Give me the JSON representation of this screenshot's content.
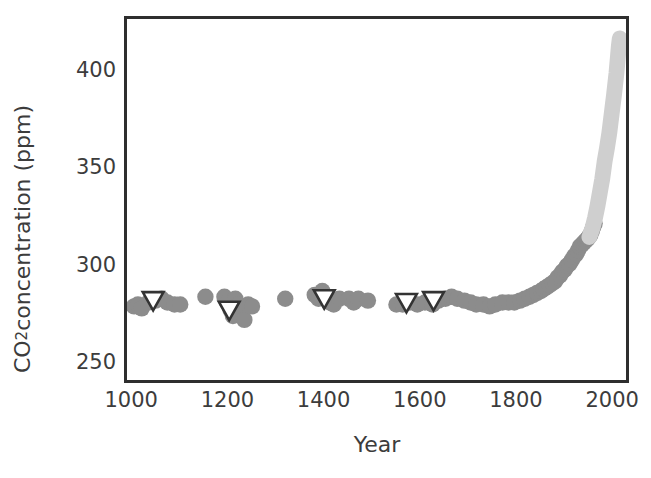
{
  "chart_data": {
    "type": "scatter",
    "title": "",
    "xlabel": "Year",
    "ylabel": "CO2 concentration (ppm)",
    "ylabel_prefix": "CO",
    "ylabel_sub": "2",
    "ylabel_suffix": " concentration (ppm)",
    "xlim": [
      985,
      2035
    ],
    "ylim": [
      240,
      428
    ],
    "xticks": [
      1000,
      1200,
      1400,
      1600,
      1800,
      2000
    ],
    "xtick_labels": [
      "1000",
      "1200",
      "1400",
      "1600",
      "1800",
      "2000"
    ],
    "yticks": [
      250,
      300,
      350,
      400
    ],
    "ytick_labels": [
      "250",
      "300",
      "350",
      "400"
    ],
    "grid": false,
    "legend": "none",
    "colors": {
      "ice_core_circle": "#8c8c8c",
      "modern_record": "#cfcfcf",
      "triangle_edge": "#333333",
      "triangle_fill": "#ffffff",
      "axis": "#2e2e2e",
      "text": "#3c3c3c"
    },
    "series": [
      {
        "name": "Ice core CO2 (circles)",
        "marker": "circle",
        "color": "#8c8c8c",
        "points": [
          [
            1000,
            279
          ],
          [
            1008,
            280
          ],
          [
            1016,
            278
          ],
          [
            1030,
            281
          ],
          [
            1045,
            282
          ],
          [
            1058,
            283
          ],
          [
            1070,
            281
          ],
          [
            1085,
            280
          ],
          [
            1097,
            280
          ],
          [
            1150,
            284
          ],
          [
            1190,
            284
          ],
          [
            1196,
            281
          ],
          [
            1203,
            277
          ],
          [
            1208,
            274
          ],
          [
            1213,
            283
          ],
          [
            1219,
            280
          ],
          [
            1224,
            276
          ],
          [
            1232,
            272
          ],
          [
            1240,
            280
          ],
          [
            1248,
            279
          ],
          [
            1318,
            283
          ],
          [
            1380,
            285
          ],
          [
            1388,
            283
          ],
          [
            1396,
            287
          ],
          [
            1404,
            284
          ],
          [
            1412,
            281
          ],
          [
            1420,
            280
          ],
          [
            1432,
            283
          ],
          [
            1452,
            283
          ],
          [
            1462,
            281
          ],
          [
            1472,
            283
          ],
          [
            1492,
            282
          ],
          [
            1552,
            280
          ],
          [
            1565,
            280
          ],
          [
            1580,
            281
          ],
          [
            1596,
            280
          ],
          [
            1612,
            281
          ],
          [
            1628,
            280
          ],
          [
            1640,
            282
          ],
          [
            1655,
            283
          ],
          [
            1668,
            284
          ],
          [
            1680,
            283
          ],
          [
            1695,
            282
          ],
          [
            1708,
            281
          ],
          [
            1720,
            280
          ],
          [
            1735,
            280
          ],
          [
            1748,
            279
          ],
          [
            1760,
            280
          ],
          [
            1775,
            281
          ],
          [
            1788,
            281
          ],
          [
            1800,
            281
          ],
          [
            1812,
            282
          ],
          [
            1822,
            283
          ],
          [
            1832,
            284
          ],
          [
            1840,
            285
          ],
          [
            1848,
            286
          ],
          [
            1856,
            287
          ],
          [
            1862,
            288
          ],
          [
            1868,
            289
          ],
          [
            1874,
            290
          ],
          [
            1880,
            291
          ],
          [
            1886,
            292
          ],
          [
            1891,
            294
          ],
          [
            1896,
            295
          ],
          [
            1901,
            297
          ],
          [
            1906,
            298
          ],
          [
            1911,
            300
          ],
          [
            1916,
            301
          ],
          [
            1921,
            303
          ],
          [
            1926,
            305
          ],
          [
            1930,
            306
          ],
          [
            1934,
            308
          ],
          [
            1938,
            310
          ],
          [
            1942,
            311
          ],
          [
            1946,
            312
          ],
          [
            1950,
            313
          ],
          [
            1954,
            314
          ],
          [
            1957,
            315
          ],
          [
            1960,
            316
          ],
          [
            1963,
            318
          ],
          [
            1966,
            320
          ],
          [
            1969,
            322
          ]
        ]
      },
      {
        "name": "Firn/other proxy (open triangles)",
        "marker": "triangle-down",
        "color": "#333333",
        "points": [
          [
            1040,
            282
          ],
          [
            1200,
            277
          ],
          [
            1400,
            283
          ],
          [
            1573,
            281
          ],
          [
            1630,
            282
          ]
        ]
      },
      {
        "name": "Direct atmospheric record",
        "marker": "line",
        "color": "#cfcfcf",
        "points": [
          [
            1958,
            315
          ],
          [
            1965,
            320
          ],
          [
            1970,
            325
          ],
          [
            1975,
            331
          ],
          [
            1980,
            338
          ],
          [
            1985,
            345
          ],
          [
            1990,
            354
          ],
          [
            1995,
            361
          ],
          [
            2000,
            369
          ],
          [
            2005,
            379
          ],
          [
            2010,
            389
          ],
          [
            2015,
            400
          ],
          [
            2020,
            414
          ],
          [
            2022,
            418
          ]
        ]
      }
    ]
  }
}
